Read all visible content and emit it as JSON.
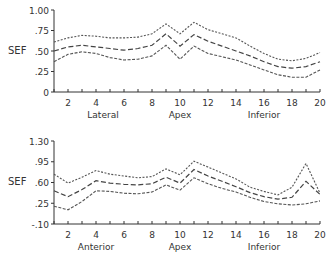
{
  "chart_data": [
    {
      "type": "line",
      "title": "",
      "ylabel": "SEF",
      "xlabel": "",
      "region_labels": [
        {
          "text": "Lateral",
          "x": 4.5
        },
        {
          "text": "Apex",
          "x": 10
        },
        {
          "text": "Inferior",
          "x": 16
        }
      ],
      "ylim": [
        0,
        1.0
      ],
      "yticks": [
        0,
        0.25,
        0.5,
        0.75,
        1.0
      ],
      "ytick_labels": [
        "0",
        ".25",
        ".50",
        ".75",
        "1.00"
      ],
      "xlim": [
        1,
        20
      ],
      "xticks": [
        2,
        4,
        6,
        8,
        10,
        12,
        14,
        16,
        18,
        20
      ],
      "xtick_labels": [
        "2",
        "4",
        "6",
        "8",
        "10",
        "12",
        "14",
        "16",
        "18",
        "20"
      ],
      "grid": false,
      "legend": null,
      "x": [
        1,
        2,
        3,
        4,
        5,
        6,
        7,
        8,
        9,
        10,
        11,
        12,
        13,
        14,
        15,
        16,
        17,
        18,
        19,
        20
      ],
      "series": [
        {
          "name": "upper",
          "style": "dotted",
          "values": [
            0.61,
            0.66,
            0.69,
            0.68,
            0.66,
            0.66,
            0.67,
            0.71,
            0.83,
            0.71,
            0.85,
            0.76,
            0.71,
            0.66,
            0.56,
            0.47,
            0.4,
            0.38,
            0.41,
            0.48
          ]
        },
        {
          "name": "mean",
          "style": "dashed",
          "values": [
            0.5,
            0.55,
            0.57,
            0.55,
            0.53,
            0.51,
            0.53,
            0.57,
            0.71,
            0.56,
            0.7,
            0.62,
            0.56,
            0.5,
            0.44,
            0.37,
            0.31,
            0.29,
            0.31,
            0.37
          ]
        },
        {
          "name": "lower",
          "style": "dotted",
          "values": [
            0.37,
            0.46,
            0.49,
            0.47,
            0.42,
            0.39,
            0.4,
            0.44,
            0.57,
            0.4,
            0.56,
            0.47,
            0.43,
            0.39,
            0.33,
            0.27,
            0.21,
            0.18,
            0.18,
            0.27
          ]
        }
      ]
    },
    {
      "type": "line",
      "title": "",
      "ylabel": "SEF",
      "xlabel": "",
      "region_labels": [
        {
          "text": "Anterior",
          "x": 4
        },
        {
          "text": "Apex",
          "x": 10
        },
        {
          "text": "Inferior",
          "x": 16
        }
      ],
      "ylim": [
        -0.1,
        1.3
      ],
      "yticks": [
        -0.1,
        0.25,
        0.6,
        0.95,
        1.3
      ],
      "ytick_labels": [
        "-.10",
        ".25",
        ".60",
        ".95",
        "1.30"
      ],
      "xlim": [
        1,
        20
      ],
      "xticks": [
        2,
        4,
        6,
        8,
        10,
        12,
        14,
        16,
        18,
        20
      ],
      "xtick_labels": [
        "2",
        "4",
        "6",
        "8",
        "10",
        "12",
        "14",
        "16",
        "18",
        "20"
      ],
      "grid": false,
      "legend": null,
      "x": [
        1,
        2,
        3,
        4,
        5,
        6,
        7,
        8,
        9,
        10,
        11,
        12,
        13,
        14,
        15,
        16,
        17,
        18,
        19,
        20
      ],
      "series": [
        {
          "name": "upper",
          "style": "dashed",
          "values": [
            0.74,
            0.59,
            0.69,
            0.8,
            0.74,
            0.71,
            0.68,
            0.7,
            0.83,
            0.73,
            0.96,
            0.86,
            0.76,
            0.66,
            0.52,
            0.45,
            0.39,
            0.52,
            0.92,
            0.42
          ]
        },
        {
          "name": "mean",
          "style": "dashed",
          "values": [
            0.46,
            0.36,
            0.48,
            0.63,
            0.59,
            0.57,
            0.56,
            0.58,
            0.69,
            0.59,
            0.82,
            0.71,
            0.62,
            0.53,
            0.43,
            0.36,
            0.32,
            0.35,
            0.62,
            0.4
          ]
        },
        {
          "name": "lower",
          "style": "dotted",
          "values": [
            0.2,
            0.14,
            0.28,
            0.46,
            0.45,
            0.42,
            0.41,
            0.44,
            0.56,
            0.47,
            0.68,
            0.58,
            0.5,
            0.44,
            0.35,
            0.28,
            0.24,
            0.22,
            0.24,
            0.29
          ]
        }
      ]
    }
  ]
}
